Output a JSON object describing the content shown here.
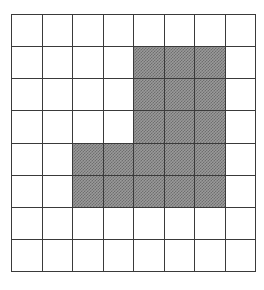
{
  "figure": {
    "grid": {
      "rows": 8,
      "columns": 8,
      "line_color": "#3a3a3a",
      "empty_color": "#ffffff",
      "shaded_color": "#9a9a9a",
      "shaded_pattern": "dither-halftone-50"
    },
    "cells": [
      [
        "empty",
        "empty",
        "empty",
        "empty",
        "empty",
        "empty",
        "empty",
        "empty"
      ],
      [
        "empty",
        "empty",
        "empty",
        "empty",
        "shaded",
        "shaded",
        "shaded",
        "empty"
      ],
      [
        "empty",
        "empty",
        "empty",
        "empty",
        "shaded",
        "shaded",
        "shaded",
        "empty"
      ],
      [
        "empty",
        "empty",
        "empty",
        "empty",
        "shaded",
        "shaded",
        "shaded",
        "empty"
      ],
      [
        "empty",
        "empty",
        "shaded",
        "shaded",
        "shaded",
        "shaded",
        "shaded",
        "empty"
      ],
      [
        "empty",
        "empty",
        "shaded",
        "shaded",
        "shaded",
        "shaded",
        "shaded",
        "empty"
      ],
      [
        "empty",
        "empty",
        "empty",
        "empty",
        "empty",
        "empty",
        "empty",
        "empty"
      ],
      [
        "empty",
        "empty",
        "empty",
        "empty",
        "empty",
        "empty",
        "empty",
        "empty"
      ]
    ],
    "shaded_count": 21,
    "total_count": 64
  }
}
